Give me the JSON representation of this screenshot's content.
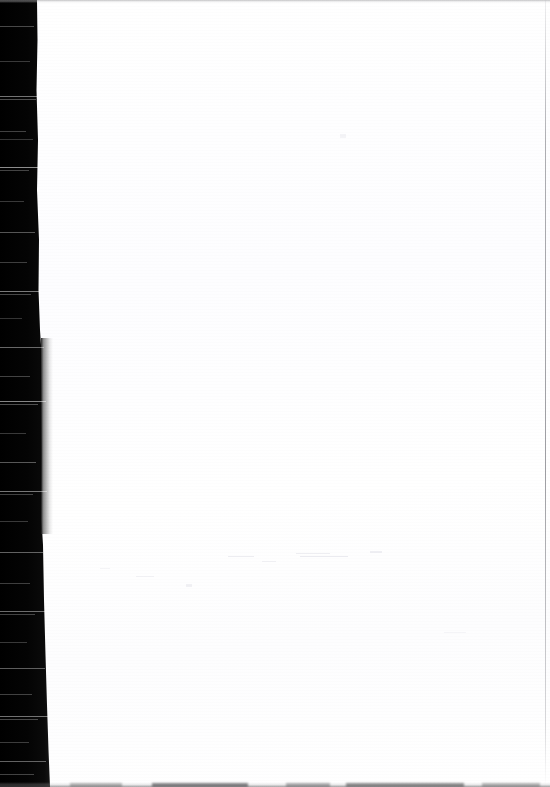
{
  "document": {
    "kind": "scanned-page",
    "page_state": "blank",
    "visible_text": "",
    "page_width_px": 550,
    "page_height_px": 787
  },
  "regions": {
    "gutter_band": {
      "name": "scanner-gutter-band",
      "position": "left",
      "color": "#030303",
      "top_width_px": 37,
      "bottom_width_px": 50
    },
    "paper": {
      "name": "paper-sheet",
      "color": "#fefeff",
      "left_edge_px": 40
    },
    "page_edge_shadow": {
      "name": "page-edge-shadow",
      "color": "#9a9a9a",
      "top_px": 338,
      "height_px": 196
    },
    "top_rule": {
      "name": "top-scan-rule",
      "color": "#96969a"
    },
    "right_rule": {
      "name": "right-scan-rule",
      "color": "#8c8c92",
      "x_px": 545
    },
    "bottom_smudge": {
      "name": "bottom-edge-smudge",
      "color": "#5a5a5c"
    }
  },
  "streaks": [
    {
      "top": 26,
      "width": 34,
      "opacity": 0.28
    },
    {
      "top": 61,
      "width": 30,
      "opacity": 0.22
    },
    {
      "top": 96,
      "width": 38,
      "opacity": 0.45
    },
    {
      "top": 99,
      "width": 36,
      "opacity": 0.3
    },
    {
      "top": 131,
      "width": 26,
      "opacity": 0.25
    },
    {
      "top": 139,
      "width": 33,
      "opacity": 0.2
    },
    {
      "top": 167,
      "width": 40,
      "opacity": 0.55
    },
    {
      "top": 170,
      "width": 29,
      "opacity": 0.26
    },
    {
      "top": 201,
      "width": 24,
      "opacity": 0.22
    },
    {
      "top": 232,
      "width": 35,
      "opacity": 0.33
    },
    {
      "top": 262,
      "width": 27,
      "opacity": 0.24
    },
    {
      "top": 291,
      "width": 41,
      "opacity": 0.48
    },
    {
      "top": 294,
      "width": 31,
      "opacity": 0.28
    },
    {
      "top": 318,
      "width": 22,
      "opacity": 0.2
    },
    {
      "top": 347,
      "width": 44,
      "opacity": 0.4
    },
    {
      "top": 376,
      "width": 30,
      "opacity": 0.26
    },
    {
      "top": 401,
      "width": 46,
      "opacity": 0.52
    },
    {
      "top": 404,
      "width": 38,
      "opacity": 0.3
    },
    {
      "top": 433,
      "width": 26,
      "opacity": 0.22
    },
    {
      "top": 462,
      "width": 36,
      "opacity": 0.34
    },
    {
      "top": 491,
      "width": 47,
      "opacity": 0.46
    },
    {
      "top": 494,
      "width": 33,
      "opacity": 0.25
    },
    {
      "top": 521,
      "width": 28,
      "opacity": 0.22
    },
    {
      "top": 552,
      "width": 43,
      "opacity": 0.38
    },
    {
      "top": 583,
      "width": 30,
      "opacity": 0.24
    },
    {
      "top": 611,
      "width": 48,
      "opacity": 0.42
    },
    {
      "top": 614,
      "width": 35,
      "opacity": 0.26
    },
    {
      "top": 642,
      "width": 27,
      "opacity": 0.22
    },
    {
      "top": 668,
      "width": 45,
      "opacity": 0.36
    },
    {
      "top": 694,
      "width": 32,
      "opacity": 0.25
    },
    {
      "top": 716,
      "width": 49,
      "opacity": 0.44
    },
    {
      "top": 719,
      "width": 38,
      "opacity": 0.28
    },
    {
      "top": 742,
      "width": 29,
      "opacity": 0.23
    },
    {
      "top": 761,
      "width": 46,
      "opacity": 0.38
    },
    {
      "top": 774,
      "width": 34,
      "opacity": 0.26
    }
  ],
  "bleed_marks": [
    {
      "left": 228,
      "top": 556,
      "width": 26,
      "height": 1,
      "opacity": 0.55
    },
    {
      "left": 262,
      "top": 561,
      "width": 14,
      "height": 1,
      "opacity": 0.4
    },
    {
      "left": 296,
      "top": 553,
      "width": 34,
      "height": 1,
      "opacity": 0.5
    },
    {
      "left": 300,
      "top": 556,
      "width": 48,
      "height": 1,
      "opacity": 0.62
    },
    {
      "left": 370,
      "top": 551,
      "width": 12,
      "height": 2,
      "opacity": 0.45
    },
    {
      "left": 136,
      "top": 576,
      "width": 18,
      "height": 1,
      "opacity": 0.35
    },
    {
      "left": 186,
      "top": 584,
      "width": 6,
      "height": 3,
      "opacity": 0.4
    },
    {
      "left": 100,
      "top": 568,
      "width": 10,
      "height": 1,
      "opacity": 0.3
    },
    {
      "left": 444,
      "top": 632,
      "width": 22,
      "height": 1,
      "opacity": 0.28
    },
    {
      "left": 340,
      "top": 134,
      "width": 6,
      "height": 4,
      "opacity": 0.3
    }
  ],
  "bottom_blotches": [
    {
      "left": 70,
      "width": 52,
      "opacity": 0.3
    },
    {
      "left": 152,
      "width": 96,
      "opacity": 0.52
    },
    {
      "left": 286,
      "width": 44,
      "opacity": 0.34
    },
    {
      "left": 346,
      "width": 118,
      "opacity": 0.48
    },
    {
      "left": 482,
      "width": 58,
      "opacity": 0.3
    }
  ]
}
